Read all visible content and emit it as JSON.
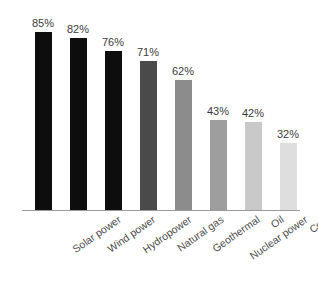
{
  "chart_data": {
    "type": "bar",
    "title": "",
    "subtitle": "",
    "xlabel": "",
    "ylabel": "",
    "ylim": [
      0,
      100
    ],
    "grid": false,
    "legend": null,
    "orientation": "vertical",
    "categories": [
      "Solar power",
      "Wind power",
      "Hydropower",
      "Natural gas",
      "Geothermal",
      "Nuclear power",
      "Oil",
      "Coal"
    ],
    "values": [
      85,
      82,
      76,
      71,
      62,
      43,
      42,
      32
    ],
    "value_labels": [
      "85%",
      "82%",
      "76%",
      "71%",
      "62%",
      "43%",
      "42%",
      "32%"
    ],
    "bar_colors": [
      "#0d0d0d",
      "#0d0d0d",
      "#0d0d0d",
      "#4a4a4a",
      "#8c8c8c",
      "#9e9e9e",
      "#c9c9c9",
      "#dedede"
    ],
    "axis_color": "#9a9a9a",
    "label_color": "#4a4a4a",
    "value_color": "#3a3a3a",
    "background": "#ffffff"
  }
}
